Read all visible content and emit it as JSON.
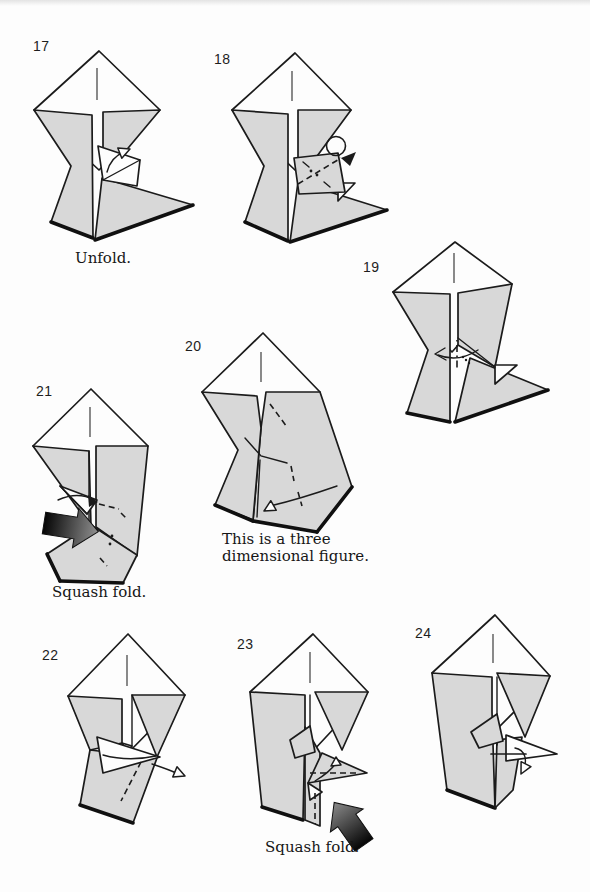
{
  "page": {
    "type": "origami instruction page",
    "background": "#fdfdfd",
    "scan_band_color": "#e3e3e3"
  },
  "colors": {
    "paper_fill": "#d8d8d8",
    "outline": "#1b1b1b",
    "push_arrow_dark": "#050505",
    "push_arrow_light": "#909090"
  },
  "figures": [
    {
      "number": "17",
      "caption": "Unfold.",
      "icons": [
        "unfold-arrow"
      ]
    },
    {
      "number": "18",
      "icons": [
        "rotate-arrow",
        "fold-dots"
      ]
    },
    {
      "number": "19",
      "icons": [
        "fold-arrow",
        "fold-dots"
      ]
    },
    {
      "number": "20",
      "caption_lines": [
        "This is a three",
        "dimensional figure."
      ],
      "icons": [
        "fold-arrow"
      ]
    },
    {
      "number": "21",
      "caption": "Squash fold.",
      "icons": [
        "push-arrow",
        "fold-arrow",
        "fold-dots"
      ]
    },
    {
      "number": "22",
      "icons": [
        "unfold-arrow"
      ]
    },
    {
      "number": "23",
      "caption": "Squash fold.",
      "icons": [
        "push-arrow",
        "fold-arrow"
      ]
    },
    {
      "number": "24",
      "icons": [
        "fold-arrow"
      ]
    }
  ]
}
